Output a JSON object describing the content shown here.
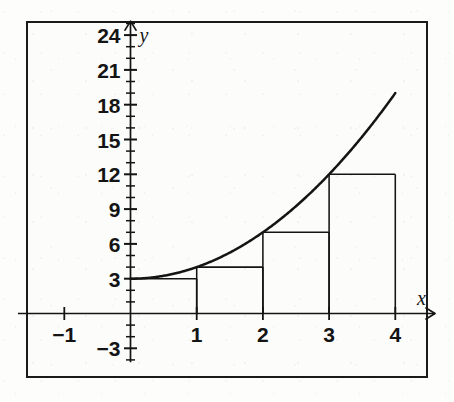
{
  "figure": {
    "background_color": "#fdfdfc",
    "ink_color": "#141414",
    "border_color": "#1a1a1a",
    "title": "",
    "axis_labels": {
      "x": "x",
      "y": "y"
    }
  },
  "chart_data": {
    "type": "area",
    "title": "",
    "xlabel": "x",
    "ylabel": "y",
    "grid": false,
    "legend": null,
    "xlim": [
      -1.7,
      4.6
    ],
    "ylim": [
      -4.2,
      25.2
    ],
    "x_ticks_major": [
      -1,
      1,
      2,
      3,
      4
    ],
    "x_tick_labels": [
      "-1",
      "1",
      "2",
      "3",
      "4"
    ],
    "x_tick_step_minor": 1,
    "y_ticks_major": [
      -3,
      3,
      6,
      9,
      12,
      15,
      18,
      21,
      24
    ],
    "y_tick_labels": [
      "-3",
      "3",
      "6",
      "9",
      "12",
      "15",
      "18",
      "21",
      "24"
    ],
    "y_tick_step_minor": 1,
    "curve": {
      "name": "f(x) = x^2 + 3",
      "expression": "x^2 + 3",
      "x_start": 0,
      "x_end": 4,
      "y_start": 3,
      "y_end": 19,
      "points": [
        {
          "x": 0,
          "y": 3
        },
        {
          "x": 0.5,
          "y": 3.25
        },
        {
          "x": 1,
          "y": 4
        },
        {
          "x": 1.5,
          "y": 5.25
        },
        {
          "x": 2,
          "y": 7
        },
        {
          "x": 2.5,
          "y": 9.25
        },
        {
          "x": 3,
          "y": 12
        },
        {
          "x": 3.5,
          "y": 15.25
        },
        {
          "x": 4,
          "y": 19
        }
      ]
    },
    "riemann_sum": {
      "method": "left-endpoint",
      "subintervals": 4,
      "interval": [
        0,
        4
      ],
      "delta_x": 1,
      "categories": [
        "[0,1]",
        "[1,2]",
        "[2,3]",
        "[3,4]"
      ],
      "x_left_edges": [
        0,
        1,
        2,
        3
      ],
      "x_right_edges": [
        1,
        2,
        3,
        4
      ],
      "values": [
        3,
        4,
        7,
        12
      ],
      "sum": 26
    }
  }
}
